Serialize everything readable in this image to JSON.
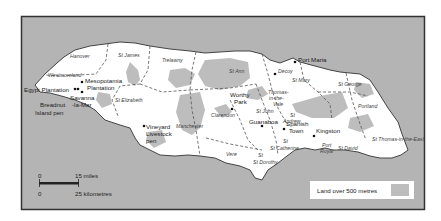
{
  "map": {
    "colors": {
      "sea": "#b4b4b4",
      "land": "#ffffff",
      "highland": "#bdbdbd",
      "frame": "#333333",
      "coast": "#444444"
    },
    "parishes": [
      {
        "name": "Hanover",
        "x": 70,
        "y": 58
      },
      {
        "name": "St James",
        "x": 118,
        "y": 57
      },
      {
        "name": "Westmoreland",
        "x": 48,
        "y": 77
      },
      {
        "name": "Trelawny",
        "x": 162,
        "y": 62
      },
      {
        "name": "St Ann",
        "x": 229,
        "y": 73
      },
      {
        "name": "St Elizabeth",
        "x": 115,
        "y": 102
      },
      {
        "name": "Manchester",
        "x": 184,
        "y": 128
      },
      {
        "name": "Clarendon",
        "x": 211,
        "y": 117
      },
      {
        "name": "St Mary",
        "x": 300,
        "y": 81
      },
      {
        "name": "St George",
        "x": 345,
        "y": 86
      },
      {
        "name": "Portland",
        "x": 362,
        "y": 108
      },
      {
        "name": "St John",
        "x": 262,
        "y": 113
      },
      {
        "name": "St Catherine",
        "x": 283,
        "y": 145
      },
      {
        "name": "Vere",
        "x": 226,
        "y": 156
      },
      {
        "name": "St Dorothy",
        "x": 263,
        "y": 160
      },
      {
        "name": "St Thomas-in-the-East",
        "x": 382,
        "y": 141
      },
      {
        "name": "St David",
        "x": 343,
        "y": 146
      }
    ],
    "places": [
      {
        "name": "Port Maria",
        "x": 298,
        "y": 58
      },
      {
        "name": "Decoy",
        "x": 278,
        "y": 73
      },
      {
        "name": "Mesopotamia",
        "x": 85,
        "y": 81
      },
      {
        "name": "Plantation",
        "x": 87,
        "y": 88
      },
      {
        "name": "Egypt Plantation",
        "x": 24,
        "y": 90
      },
      {
        "name": "Savanna",
        "x": 70,
        "y": 97
      },
      {
        "name": "-la-Mar",
        "x": 72,
        "y": 104
      },
      {
        "name": "Breadnut",
        "x": 40,
        "y": 104
      },
      {
        "name": "Island pen",
        "x": 36,
        "y": 112
      },
      {
        "name": "Worthy",
        "x": 232,
        "y": 95
      },
      {
        "name": "Park",
        "x": 236,
        "y": 102
      },
      {
        "name": "Thomas-",
        "x": 269,
        "y": 92
      },
      {
        "name": "in-the-",
        "x": 270,
        "y": 99
      },
      {
        "name": "Vale",
        "x": 274,
        "y": 106
      },
      {
        "name": "Guanaboa",
        "x": 250,
        "y": 123
      },
      {
        "name": "Spanish",
        "x": 287,
        "y": 124
      },
      {
        "name": "Town",
        "x": 290,
        "y": 131
      },
      {
        "name": "Kingston",
        "x": 316,
        "y": 131
      },
      {
        "name": "Port",
        "x": 321,
        "y": 145
      },
      {
        "name": "Royal",
        "x": 319,
        "y": 151
      },
      {
        "name": "Vineyard",
        "x": 145,
        "y": 129
      },
      {
        "name": "Livestock",
        "x": 145,
        "y": 136
      },
      {
        "name": "pen",
        "x": 145,
        "y": 143
      }
    ],
    "parish_extra": [
      {
        "name": "St",
        "x": 290,
        "y": 117
      },
      {
        "name": "Andrew",
        "x": 283,
        "y": 123
      },
      {
        "name": "St",
        "x": 285,
        "y": 143
      },
      {
        "name": "St",
        "x": 258,
        "y": 154
      }
    ],
    "scale": {
      "miles_zero": "0",
      "miles_label": "15 miles",
      "km_zero": "0",
      "km_label": "25 kilometres"
    },
    "legend": {
      "label": "Land over 500 metres"
    }
  }
}
